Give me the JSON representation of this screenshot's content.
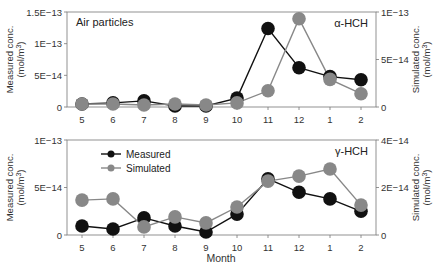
{
  "figure": {
    "x_label": "Month",
    "legend": [
      {
        "label": "Measured",
        "color": "#111111"
      },
      {
        "label": "Simulated",
        "color": "#888888"
      }
    ]
  },
  "chart_data": [
    {
      "type": "line",
      "title": "Air particles",
      "annotation": "α-HCH",
      "categories": [
        "5",
        "6",
        "7",
        "8",
        "9",
        "10",
        "11",
        "12",
        "1",
        "2"
      ],
      "xlabel": "Month",
      "ylabel": "Measured conc. (mol/m³)",
      "ylabel_right": "Simulated conc. (mol/m³)",
      "ylim": [
        0,
        1.5e-13
      ],
      "ylim_right": [
        0,
        1e-13
      ],
      "yticks": [
        {
          "v": 0,
          "label": "0"
        },
        {
          "v": 5e-14,
          "label": "5E−14"
        },
        {
          "v": 1e-13,
          "label": "1E−13"
        },
        {
          "v": 1.5e-13,
          "label": "1.5E−13"
        }
      ],
      "yticks_right": [
        {
          "v": 0,
          "label": "0"
        },
        {
          "v": 5e-14,
          "label": "5E−14"
        },
        {
          "v": 1e-13,
          "label": "1E−13"
        }
      ],
      "series": [
        {
          "name": "Measured",
          "axis": "left",
          "color": "#111111",
          "values": [
            4.8e-15,
            6.4e-15,
            9.6e-15,
            1.6e-15,
            1.6e-15,
            1.4e-14,
            1.24e-13,
            6.2e-14,
            4.8e-14,
            4.3e-14
          ]
        },
        {
          "name": "Simulated",
          "axis": "right",
          "color": "#888888",
          "values": [
            3.2e-15,
            3.2e-15,
            2.1e-15,
            3.2e-15,
            2.1e-15,
            4.3e-15,
            1.7e-14,
            9.3e-14,
            2.9e-14,
            1.4e-14
          ]
        }
      ],
      "grid": false,
      "legend_position": "none"
    },
    {
      "type": "line",
      "title": "",
      "annotation": "γ-HCH",
      "categories": [
        "5",
        "6",
        "7",
        "8",
        "9",
        "10",
        "11",
        "12",
        "1",
        "2"
      ],
      "xlabel": "Month",
      "ylabel": "Measured conc. (mol/m³)",
      "ylabel_right": "Simulated conc. (mol/m³)",
      "ylim": [
        0,
        1e-13
      ],
      "ylim_right": [
        0,
        4e-14
      ],
      "yticks": [
        {
          "v": 0,
          "label": "0"
        },
        {
          "v": 5e-14,
          "label": "5E−14"
        },
        {
          "v": 1e-13,
          "label": "1E−13"
        }
      ],
      "yticks_right": [
        {
          "v": 0,
          "label": "0"
        },
        {
          "v": 2e-14,
          "label": "2E−14"
        },
        {
          "v": 4e-14,
          "label": "4E−14"
        }
      ],
      "series": [
        {
          "name": "Measured",
          "axis": "left",
          "color": "#111111",
          "values": [
            9.5e-15,
            6.3e-15,
            1.8e-14,
            9.5e-15,
            3.2e-15,
            2.2e-14,
            5.9e-14,
            4.5e-14,
            3.8e-14,
            2.5e-14
          ]
        },
        {
          "name": "Simulated",
          "axis": "right",
          "color": "#888888",
          "values": [
            1.47e-14,
            1.52e-14,
            3.4e-15,
            7.6e-15,
            5.1e-15,
            1.18e-14,
            2.27e-14,
            2.48e-14,
            2.78e-14,
            1.26e-14
          ]
        }
      ],
      "grid": false,
      "legend_position": "upper left"
    }
  ]
}
